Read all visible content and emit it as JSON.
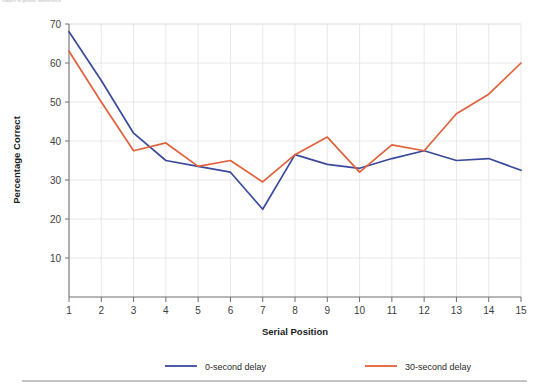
{
  "figure": {
    "top_note": "subject to genetic interference",
    "bottom_rule": true
  },
  "chart_data": {
    "type": "line",
    "title": "",
    "xlabel": "Serial Position",
    "ylabel": "Percentage Correct",
    "categories": [
      1,
      2,
      3,
      4,
      5,
      6,
      7,
      8,
      9,
      10,
      11,
      12,
      13,
      14,
      15
    ],
    "x": [
      1,
      2,
      3,
      4,
      5,
      6,
      7,
      8,
      9,
      10,
      11,
      12,
      13,
      14,
      15
    ],
    "xlim": [
      1,
      15
    ],
    "ylim": [
      0,
      70
    ],
    "yticks": [
      10,
      20,
      30,
      40,
      50,
      60,
      70
    ],
    "xticks": [
      1,
      2,
      3,
      4,
      5,
      6,
      7,
      8,
      9,
      10,
      11,
      12,
      13,
      14,
      15
    ],
    "grid": true,
    "legend_position": "bottom",
    "series": [
      {
        "name": "0-second delay",
        "color": "#3b4a9c",
        "values": [
          68,
          55.5,
          42,
          35,
          33.5,
          32,
          22.5,
          36.5,
          34,
          33,
          35.5,
          37.5,
          35,
          35.5,
          32.5
        ]
      },
      {
        "name": "30-second delay",
        "color": "#e0613a",
        "values": [
          63,
          50,
          37.5,
          39.5,
          33.5,
          35,
          29.5,
          36.5,
          41,
          32,
          39,
          37.5,
          47,
          52,
          60
        ]
      }
    ]
  },
  "axes": {
    "y_tick_labels": [
      "10",
      "20",
      "30",
      "40",
      "50",
      "60",
      "70"
    ],
    "x_tick_labels": [
      "1",
      "2",
      "3",
      "4",
      "5",
      "6",
      "7",
      "8",
      "9",
      "10",
      "11",
      "12",
      "13",
      "14",
      "15"
    ],
    "y_axis_title": "Percentage Correct",
    "x_axis_title": "Serial Position"
  },
  "legend": {
    "items": [
      {
        "label": "0-second delay",
        "color": "#3b4a9c"
      },
      {
        "label": "30-second delay",
        "color": "#e0613a"
      }
    ]
  }
}
